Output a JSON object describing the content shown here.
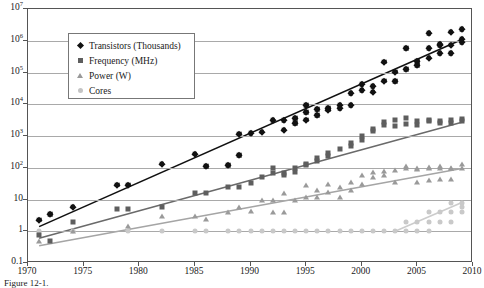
{
  "figure": {
    "caption": "Figure 12-1.",
    "background_color": "#ffffff"
  },
  "legend": {
    "position": "upper-left-inset",
    "entries": [
      {
        "label": "Transistors (Thousands)",
        "marker": "diamond-icon",
        "color": "#111111"
      },
      {
        "label": "Frequency (MHz)",
        "marker": "square-icon",
        "color": "#5e5e5e"
      },
      {
        "label": "Power (W)",
        "marker": "triangle-icon",
        "color": "#9a9a9a"
      },
      {
        "label": "Cores",
        "marker": "circle-icon",
        "color": "#c9c9c9"
      }
    ]
  },
  "axes": {
    "y_tick_labels": [
      "10^7",
      "10^6",
      "10^5",
      "10^4",
      "10^3",
      "10^2",
      "10",
      "1",
      "0.1"
    ],
    "y_tick_bases": [
      "10",
      "10",
      "10",
      "10",
      "10",
      "10",
      "10",
      "1",
      "0.1"
    ],
    "y_tick_exps": [
      "7",
      "6",
      "5",
      "4",
      "3",
      "2",
      "",
      "",
      ""
    ],
    "x_tick_labels": [
      "1970",
      "1975",
      "1980",
      "1985",
      "1990",
      "1995",
      "2000",
      "2005",
      "2010"
    ]
  },
  "chart_data": {
    "type": "scatter",
    "title": "",
    "subtitle": "",
    "xlabel": "",
    "ylabel": "",
    "xlim": [
      1970,
      2010
    ],
    "ylim": [
      0.1,
      10000000
    ],
    "yscale": "log",
    "grid": true,
    "legend_position": "upper-left",
    "xticks": [
      1970,
      1975,
      1980,
      1985,
      1990,
      1995,
      2000,
      2005,
      2010
    ],
    "yticks": [
      0.1,
      1,
      10,
      100,
      1000,
      10000,
      100000,
      1000000,
      10000000
    ],
    "series": [
      {
        "name": "Transistors (Thousands)",
        "marker": "diamond",
        "color": "#111111",
        "trend_line": {
          "from": [
            1971,
            1.4
          ],
          "to": [
            2009,
            1100000
          ],
          "color": "#111111"
        },
        "points": [
          [
            1971,
            2.3
          ],
          [
            1972,
            3.5
          ],
          [
            1974,
            6.0
          ],
          [
            1978,
            29
          ],
          [
            1979,
            29
          ],
          [
            1982,
            134
          ],
          [
            1985,
            275
          ],
          [
            1986,
            110
          ],
          [
            1988,
            120
          ],
          [
            1989,
            1180
          ],
          [
            1989,
            250
          ],
          [
            1990,
            1200
          ],
          [
            1991,
            1350
          ],
          [
            1992,
            3100
          ],
          [
            1993,
            3100
          ],
          [
            1993,
            1600
          ],
          [
            1994,
            2500
          ],
          [
            1994,
            3600
          ],
          [
            1995,
            5500
          ],
          [
            1995,
            9300
          ],
          [
            1995,
            3300
          ],
          [
            1996,
            6900
          ],
          [
            1996,
            4500
          ],
          [
            1997,
            7500
          ],
          [
            1997,
            6800
          ],
          [
            1998,
            9500
          ],
          [
            1998,
            7500
          ],
          [
            1999,
            22000
          ],
          [
            1999,
            9500
          ],
          [
            2000,
            42000
          ],
          [
            2000,
            28000
          ],
          [
            2001,
            25000
          ],
          [
            2001,
            37000
          ],
          [
            2002,
            55000
          ],
          [
            2002,
            220000
          ],
          [
            2003,
            54000
          ],
          [
            2003,
            106000
          ],
          [
            2004,
            125000
          ],
          [
            2004,
            592000
          ],
          [
            2005,
            230000
          ],
          [
            2005,
            169000
          ],
          [
            2006,
            291000
          ],
          [
            2006,
            582000
          ],
          [
            2006,
            1720000
          ],
          [
            2007,
            731000
          ],
          [
            2007,
            411000
          ],
          [
            2007,
            789000
          ],
          [
            2008,
            758000
          ],
          [
            2008,
            1900000
          ],
          [
            2008,
            410000
          ],
          [
            2009,
            904000
          ],
          [
            2009,
            1170000
          ],
          [
            2009,
            2300000
          ]
        ]
      },
      {
        "name": "Frequency (MHz)",
        "marker": "square",
        "color": "#5e5e5e",
        "trend_line": {
          "from": [
            1971,
            0.6
          ],
          "to": [
            2009,
            2700
          ],
          "color": "#6a6a6a"
        },
        "points": [
          [
            1971,
            0.74
          ],
          [
            1972,
            0.5
          ],
          [
            1974,
            2.0
          ],
          [
            1978,
            5.0
          ],
          [
            1979,
            5.0
          ],
          [
            1982,
            6.0
          ],
          [
            1985,
            16
          ],
          [
            1986,
            16
          ],
          [
            1988,
            25
          ],
          [
            1989,
            25
          ],
          [
            1990,
            33
          ],
          [
            1991,
            50
          ],
          [
            1992,
            66
          ],
          [
            1992,
            100
          ],
          [
            1993,
            60
          ],
          [
            1993,
            66
          ],
          [
            1994,
            75
          ],
          [
            1994,
            100
          ],
          [
            1995,
            120
          ],
          [
            1995,
            133
          ],
          [
            1996,
            200
          ],
          [
            1996,
            166
          ],
          [
            1997,
            233
          ],
          [
            1997,
            300
          ],
          [
            1998,
            400
          ],
          [
            1999,
            500
          ],
          [
            1999,
            600
          ],
          [
            2000,
            733
          ],
          [
            2000,
            1000
          ],
          [
            2001,
            1400
          ],
          [
            2001,
            1700
          ],
          [
            2002,
            2200
          ],
          [
            2002,
            2800
          ],
          [
            2003,
            3200
          ],
          [
            2003,
            2000
          ],
          [
            2004,
            3600
          ],
          [
            2004,
            2400
          ],
          [
            2005,
            3000
          ],
          [
            2005,
            2200
          ],
          [
            2006,
            2930
          ],
          [
            2006,
            3200
          ],
          [
            2007,
            3000
          ],
          [
            2007,
            2600
          ],
          [
            2008,
            3200
          ],
          [
            2008,
            2660
          ],
          [
            2009,
            2930
          ],
          [
            2009,
            3330
          ]
        ]
      },
      {
        "name": "Power (W)",
        "marker": "triangle",
        "color": "#9a9a9a",
        "trend_line": {
          "from": [
            1971,
            0.35
          ],
          "to": [
            2009,
            95
          ],
          "color": "#a5a5a5"
        },
        "points": [
          [
            1971,
            0.5
          ],
          [
            1974,
            1.0
          ],
          [
            1979,
            1.5
          ],
          [
            1982,
            3.0
          ],
          [
            1985,
            3.0
          ],
          [
            1986,
            2.5
          ],
          [
            1988,
            4.0
          ],
          [
            1989,
            6.0
          ],
          [
            1990,
            4.5
          ],
          [
            1991,
            10
          ],
          [
            1992,
            10
          ],
          [
            1992,
            4.0
          ],
          [
            1993,
            16
          ],
          [
            1993,
            4.0
          ],
          [
            1994,
            10
          ],
          [
            1995,
            12
          ],
          [
            1995,
            28
          ],
          [
            1996,
            20
          ],
          [
            1996,
            12
          ],
          [
            1997,
            30
          ],
          [
            1997,
            17
          ],
          [
            1998,
            25
          ],
          [
            1998,
            12
          ],
          [
            1999,
            35
          ],
          [
            1999,
            20
          ],
          [
            2000,
            60
          ],
          [
            2000,
            30
          ],
          [
            2001,
            75
          ],
          [
            2001,
            50
          ],
          [
            2002,
            80
          ],
          [
            2002,
            60
          ],
          [
            2003,
            85
          ],
          [
            2003,
            35
          ],
          [
            2004,
            115
          ],
          [
            2004,
            95
          ],
          [
            2005,
            100
          ],
          [
            2005,
            90
          ],
          [
            2005,
            35
          ],
          [
            2006,
            105
          ],
          [
            2006,
            95
          ],
          [
            2006,
            40
          ],
          [
            2007,
            110
          ],
          [
            2007,
            95
          ],
          [
            2007,
            45
          ],
          [
            2008,
            100
          ],
          [
            2008,
            95
          ],
          [
            2008,
            45
          ],
          [
            2009,
            130
          ],
          [
            2009,
            95
          ]
        ]
      },
      {
        "name": "Cores",
        "marker": "circle",
        "color": "#c9c9c9",
        "trend_line": {
          "from": [
            2003,
            1
          ],
          "to": [
            2009,
            8
          ],
          "color": "#cccccc"
        },
        "points": [
          [
            1971,
            1
          ],
          [
            1974,
            1
          ],
          [
            1979,
            1
          ],
          [
            1982,
            1
          ],
          [
            1985,
            1
          ],
          [
            1986,
            1
          ],
          [
            1988,
            1
          ],
          [
            1989,
            1
          ],
          [
            1990,
            1
          ],
          [
            1991,
            1
          ],
          [
            1992,
            1
          ],
          [
            1993,
            1
          ],
          [
            1994,
            1
          ],
          [
            1995,
            1
          ],
          [
            1996,
            1
          ],
          [
            1997,
            1
          ],
          [
            1998,
            1
          ],
          [
            1999,
            1
          ],
          [
            2000,
            1
          ],
          [
            2001,
            1
          ],
          [
            2002,
            1
          ],
          [
            2003,
            1
          ],
          [
            2004,
            1
          ],
          [
            2004,
            2
          ],
          [
            2005,
            2
          ],
          [
            2005,
            1
          ],
          [
            2006,
            2
          ],
          [
            2006,
            4
          ],
          [
            2006,
            1
          ],
          [
            2007,
            2
          ],
          [
            2007,
            4
          ],
          [
            2008,
            4
          ],
          [
            2008,
            2
          ],
          [
            2008,
            8
          ],
          [
            2009,
            4
          ],
          [
            2009,
            6
          ],
          [
            2009,
            8
          ]
        ]
      }
    ]
  }
}
